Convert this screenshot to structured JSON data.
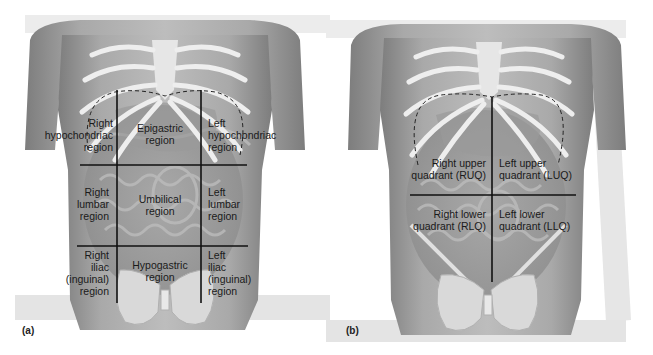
{
  "figure": {
    "panel_a": {
      "tag": "(a)",
      "title": "Nine abdominal regions",
      "regions": {
        "right_hypochondriac": [
          "Right",
          "hypochondriac",
          "region"
        ],
        "epigastric": [
          "Epigastric",
          "region"
        ],
        "left_hypochondriac": [
          "Left",
          "hypochondriac",
          "region"
        ],
        "right_lumbar": [
          "Right",
          "lumbar",
          "region"
        ],
        "umbilical": [
          "Umbilical",
          "region"
        ],
        "left_lumbar": [
          "Left",
          "lumbar",
          "region"
        ],
        "right_iliac": [
          "Right",
          "iliac",
          "(inguinal)",
          "region"
        ],
        "hypogastric": [
          "Hypogastric",
          "region"
        ],
        "left_iliac": [
          "Left",
          "iliac",
          "(inguinal)",
          "region"
        ]
      }
    },
    "panel_b": {
      "tag": "(b)",
      "title": "Four abdominal quadrants",
      "quadrants": {
        "ruq": [
          "Right upper",
          "quadrant (RUQ)"
        ],
        "luq": [
          "Left upper",
          "quadrant (LUQ)"
        ],
        "rlq": [
          "Right lower",
          "quadrant (RLQ)"
        ],
        "llq": [
          "Left lower",
          "quadrant (LLQ)"
        ]
      }
    },
    "colors": {
      "skin_light": "#cfcfcf",
      "skin_dark": "#8a8a8a",
      "bone": "#ececec",
      "divider_line": "#111111",
      "label_text": "#1a1a1a"
    }
  }
}
